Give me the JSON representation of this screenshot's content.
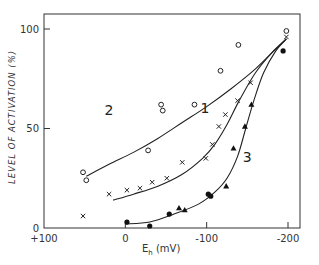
{
  "chart_data": {
    "type": "scatter",
    "title": "",
    "xlabel": "E",
    "xlabel_sub": "h",
    "xlabel_unit": " (mV)",
    "ylabel": "LEVEL  OF  ACTIVATION (%)",
    "xlim": [
      100,
      -200
    ],
    "ylim": [
      0,
      100
    ],
    "x_ticks": [
      100,
      0,
      -100,
      -200
    ],
    "x_tick_labels": [
      "+100",
      "0",
      "-100",
      "-200"
    ],
    "y_ticks": [
      0,
      50,
      100
    ],
    "y_tick_labels": [
      "0",
      "50",
      "100"
    ],
    "grid": false,
    "legend": "none",
    "series": [
      {
        "name": "2",
        "marker": "open-circle",
        "points": [
          [
            52,
            28
          ],
          [
            48,
            24
          ],
          [
            -28,
            39
          ],
          [
            -44,
            62
          ],
          [
            -46,
            59
          ],
          [
            -85,
            62
          ],
          [
            -117,
            79
          ],
          [
            -139,
            92
          ],
          [
            -198,
            99
          ]
        ],
        "fit": [
          [
            48,
            26
          ],
          [
            20,
            32
          ],
          [
            -10,
            38
          ],
          [
            -40,
            45
          ],
          [
            -70,
            53
          ],
          [
            -100,
            61
          ],
          [
            -130,
            70
          ],
          [
            -160,
            80
          ],
          [
            -185,
            90
          ],
          [
            -198,
            95
          ]
        ],
        "label_pos": [
          20,
          57
        ]
      },
      {
        "name": "1",
        "marker": "cross",
        "points": [
          [
            52,
            6
          ],
          [
            20,
            17
          ],
          [
            -2,
            19
          ],
          [
            -18,
            20
          ],
          [
            -33,
            23
          ],
          [
            -51,
            25
          ],
          [
            -70,
            33
          ],
          [
            -99,
            35
          ],
          [
            -107,
            42
          ],
          [
            -115,
            51
          ],
          [
            -123,
            57
          ],
          [
            -138,
            64
          ],
          [
            -154,
            73
          ],
          [
            -198,
            96
          ]
        ],
        "fit": [
          [
            15,
            14
          ],
          [
            -10,
            17
          ],
          [
            -40,
            21
          ],
          [
            -70,
            27
          ],
          [
            -95,
            35
          ],
          [
            -110,
            42
          ],
          [
            -125,
            52
          ],
          [
            -140,
            64
          ],
          [
            -160,
            78
          ],
          [
            -180,
            88
          ],
          [
            -198,
            95
          ]
        ],
        "label_pos": [
          -98,
          58
        ]
      },
      {
        "name": "3",
        "marker": "filled-circle/triangle",
        "points": [
          [
            -2,
            3
          ],
          [
            -30,
            1
          ],
          [
            -54,
            7
          ],
          [
            -66,
            10
          ],
          [
            -73,
            9
          ],
          [
            -102,
            17
          ],
          [
            -105,
            16
          ],
          [
            -124,
            21
          ],
          [
            -133,
            40
          ],
          [
            -147,
            51
          ],
          [
            -155,
            62
          ],
          [
            -194,
            89
          ]
        ],
        "fit": [
          [
            0,
            2
          ],
          [
            -30,
            3
          ],
          [
            -60,
            7
          ],
          [
            -90,
            12
          ],
          [
            -110,
            18
          ],
          [
            -125,
            25
          ],
          [
            -138,
            36
          ],
          [
            -148,
            50
          ],
          [
            -158,
            64
          ],
          [
            -170,
            78
          ],
          [
            -185,
            89
          ],
          [
            -198,
            95
          ]
        ],
        "label_pos": [
          -150,
          33
        ]
      }
    ]
  }
}
